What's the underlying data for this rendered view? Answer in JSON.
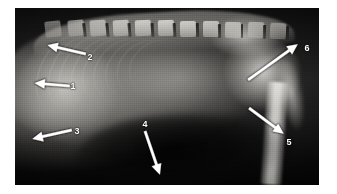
{
  "figure": {
    "modality": "radiograph",
    "background_color": "#ffffff",
    "plate": {
      "x": 15,
      "y": 8,
      "width": 304,
      "height": 177,
      "film_dark": "#0d0d0d",
      "bone_bright": "#f6f5f0"
    }
  },
  "markers": [
    {
      "id": "marker-1",
      "label": "1",
      "label_x": 73,
      "label_y": 86,
      "arrow_tail_x": 70,
      "arrow_tail_y": 86,
      "arrow_tip_x": 34,
      "arrow_tip_y": 83,
      "arrow_color": "#ffffff"
    },
    {
      "id": "marker-2",
      "label": "2",
      "label_x": 90,
      "label_y": 57,
      "arrow_tail_x": 86,
      "arrow_tail_y": 54,
      "arrow_tip_x": 47,
      "arrow_tip_y": 45,
      "arrow_color": "#ffffff"
    },
    {
      "id": "marker-3",
      "label": "3",
      "label_x": 77,
      "label_y": 131,
      "arrow_tail_x": 72,
      "arrow_tail_y": 130,
      "arrow_tip_x": 32,
      "arrow_tip_y": 139,
      "arrow_color": "#ffffff"
    },
    {
      "id": "marker-4",
      "label": "4",
      "label_x": 145,
      "label_y": 124,
      "arrow_tail_x": 145,
      "arrow_tail_y": 131,
      "arrow_tip_x": 160,
      "arrow_tip_y": 175,
      "arrow_color": "#ffffff"
    },
    {
      "id": "marker-5",
      "label": "5",
      "label_x": 289,
      "label_y": 142,
      "arrow_tail_x": 249,
      "arrow_tail_y": 108,
      "arrow_tip_x": 284,
      "arrow_tip_y": 134,
      "arrow_color": "#ffffff"
    },
    {
      "id": "marker-6",
      "label": "6",
      "label_x": 307,
      "label_y": 48,
      "arrow_tail_x": 248,
      "arrow_tail_y": 80,
      "arrow_tip_x": 298,
      "arrow_tip_y": 44,
      "arrow_color": "#ffffff"
    }
  ]
}
